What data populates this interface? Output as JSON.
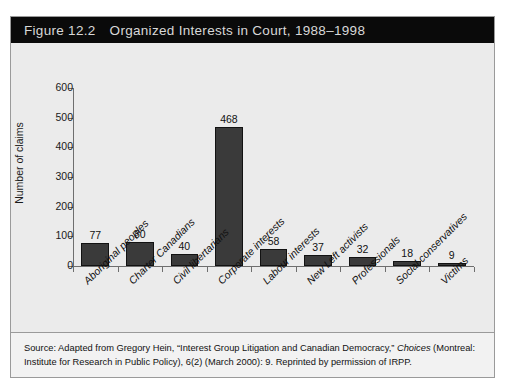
{
  "figure": {
    "number": "Figure 12.2",
    "title": "Organized Interests in Court, 1988–1998"
  },
  "source_note": {
    "part1": "Source: Adapted from Gregory Hein, “Interest Group Litigation and Canadian Democracy,” ",
    "italic": "Choices",
    "part2": " (Montreal: Institute for Research in Public Policy), 6(2) (March 2000): 9. Reprinted by permission of IRPP."
  },
  "colors": {
    "title_bar": "#0a0a0a",
    "title_text": "#d8d8d8",
    "panel_bg": "#ebebeb",
    "bar_fill": "#3a3a3a",
    "bar_edge": "#121212",
    "axis": "#6e6e6e",
    "frame": "#9a9a9a"
  },
  "chart_data": {
    "type": "bar",
    "title": "Organized Interests in Court, 1988–1998",
    "xlabel": "",
    "ylabel": "Number of claims",
    "ylim": [
      0,
      600
    ],
    "yticks": [
      0,
      100,
      200,
      300,
      400,
      500,
      600
    ],
    "grid": false,
    "legend": false,
    "value_labels": true,
    "categories": [
      "Aboriginal peoples",
      "Charter Canadians",
      "Civil libertarians",
      "Corporate interests",
      "Labour interests",
      "New Left activists",
      "Professionals",
      "Social conservatives",
      "Victims"
    ],
    "values": [
      77,
      80,
      40,
      468,
      58,
      37,
      32,
      18,
      9
    ]
  }
}
